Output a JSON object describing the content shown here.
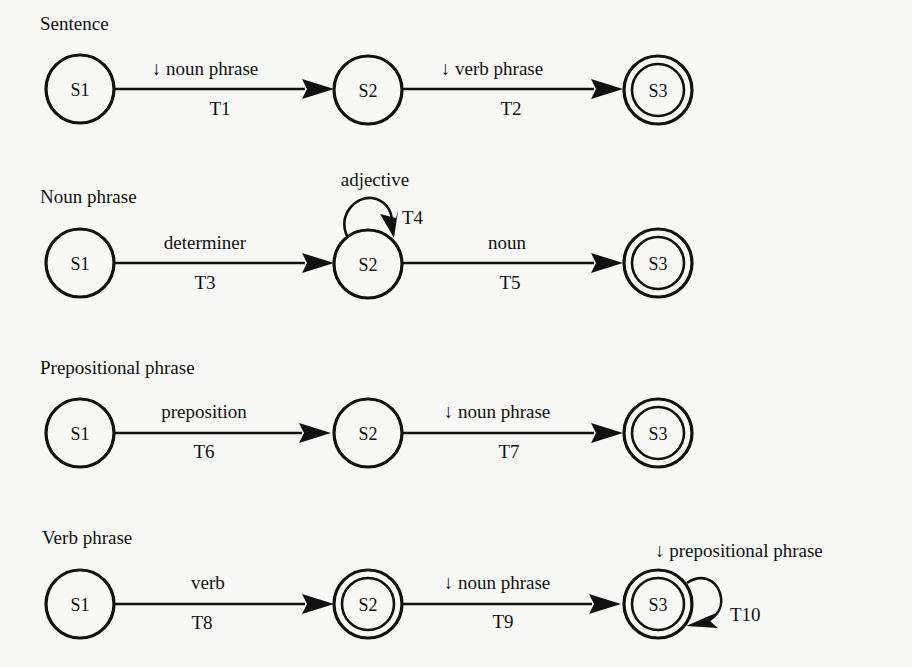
{
  "diagram": {
    "type": "augmented transition network",
    "networks": [
      {
        "title": "Sentence",
        "states": [
          {
            "id": "S1",
            "final": false
          },
          {
            "id": "S2",
            "final": false
          },
          {
            "id": "S3",
            "final": true
          }
        ],
        "transitions": [
          {
            "id": "T1",
            "from": "S1",
            "to": "S2",
            "label": "↓ noun phrase"
          },
          {
            "id": "T2",
            "from": "S2",
            "to": "S3",
            "label": "↓ verb phrase"
          }
        ]
      },
      {
        "title": "Noun phrase",
        "states": [
          {
            "id": "S1",
            "final": false
          },
          {
            "id": "S2",
            "final": false
          },
          {
            "id": "S3",
            "final": true
          }
        ],
        "transitions": [
          {
            "id": "T3",
            "from": "S1",
            "to": "S2",
            "label": "determiner"
          },
          {
            "id": "T4",
            "from": "S2",
            "to": "S2",
            "label": "adjective"
          },
          {
            "id": "T5",
            "from": "S2",
            "to": "S3",
            "label": "noun"
          }
        ]
      },
      {
        "title": "Prepositional phrase",
        "states": [
          {
            "id": "S1",
            "final": false
          },
          {
            "id": "S2",
            "final": false
          },
          {
            "id": "S3",
            "final": true
          }
        ],
        "transitions": [
          {
            "id": "T6",
            "from": "S1",
            "to": "S2",
            "label": "preposition"
          },
          {
            "id": "T7",
            "from": "S2",
            "to": "S3",
            "label": "↓ noun phrase"
          }
        ]
      },
      {
        "title": "Verb phrase",
        "states": [
          {
            "id": "S1",
            "final": false
          },
          {
            "id": "S2",
            "final": true
          },
          {
            "id": "S3",
            "final": true
          }
        ],
        "transitions": [
          {
            "id": "T8",
            "from": "S1",
            "to": "S2",
            "label": "verb"
          },
          {
            "id": "T9",
            "from": "S2",
            "to": "S3",
            "label": "↓ noun phrase"
          },
          {
            "id": "T10",
            "from": "S3",
            "to": "S3",
            "label": "↓ prepositional phrase"
          }
        ]
      }
    ]
  }
}
